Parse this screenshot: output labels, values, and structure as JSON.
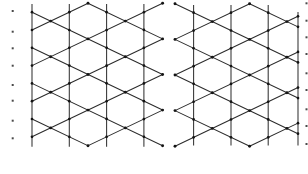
{
  "diagram": {
    "width": 308,
    "height": 174,
    "background": "#ffffff",
    "line_color": "#2b2b2b",
    "vertical_color": "#333333",
    "node_color": "#141414",
    "edge_dot_color": "#4a4a4a",
    "line_width": 1.05,
    "slope": 0.477,
    "period": 35.6,
    "column_spacing": 37.3,
    "panels": [
      {
        "name": "left-lattice",
        "clip": {
          "x0": 32.0,
          "x1": 162.6,
          "y0": 3.3,
          "y1": 145.8
        },
        "base_x": 88.0,
        "base_y": 3.3,
        "verticals": [
          {
            "x": 32.0,
            "y0": 4.0,
            "y1": 146.7
          },
          {
            "x": 69.3,
            "y0": 4.0,
            "y1": 146.7
          },
          {
            "x": 106.6,
            "y0": 4.0,
            "y1": 146.7
          },
          {
            "x": 143.9,
            "y0": 4.0,
            "y1": 146.7
          }
        ]
      },
      {
        "name": "right-lattice",
        "clip": {
          "x0": 175.0,
          "x1": 298.0,
          "y0": 3.8,
          "y1": 146.2
        },
        "base_x": 175.0,
        "base_y": 3.8,
        "verticals": [
          {
            "x": 193.6,
            "y0": 5.0,
            "y1": 145.5
          },
          {
            "x": 231.0,
            "y0": 5.0,
            "y1": 145.5
          },
          {
            "x": 268.2,
            "y0": 5.0,
            "y1": 145.5
          },
          {
            "x": 298.0,
            "y0": 12.0,
            "y1": 145.5
          }
        ]
      }
    ],
    "edge_dots": {
      "left": {
        "x": 12.7,
        "y": [
          11.0,
          31.7,
          48.3,
          65.7,
          85.0,
          100.7,
          120.7,
          138.3
        ]
      },
      "right": {
        "x": 306.5,
        "y": [
          3.3,
          20.7,
          37.3,
          54.0,
          73.3,
          90.0,
          109.3,
          126.0,
          144.0
        ]
      }
    }
  }
}
